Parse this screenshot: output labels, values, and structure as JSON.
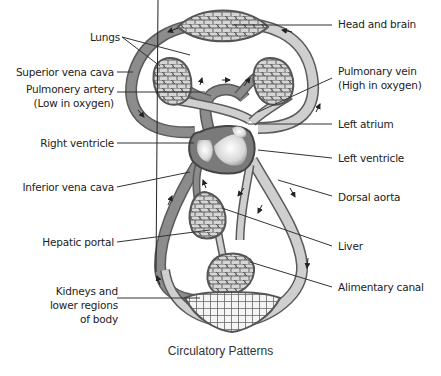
{
  "figure": {
    "caption": "Circulatory Patterns",
    "colors": {
      "deoxygenated_vessel": "#8c8c8c",
      "oxygenated_vessel": "#cfcfcf",
      "outline": "#5a5a5a",
      "capillary_fill": "#d6d6d6",
      "heart_fill": "#9a9a9a",
      "leader_line": "#333333"
    }
  },
  "labels": {
    "left": {
      "lungs": "Lungs",
      "superior_vena_cava": "Superior vena cava",
      "pulmonary_artery_1": "Pulmonery artery",
      "pulmonary_artery_2": "(Low in oxygen)",
      "right_ventricle": "Right ventricle",
      "inferior_vena_cava": "Inferior vena cava",
      "hepatic_portal": "Hepatic portal",
      "kidneys_1": "Kidneys and",
      "kidneys_2": "lower regions",
      "kidneys_3": "of body"
    },
    "right": {
      "head_and_brain": "Head and brain",
      "pulmonary_vein_1": "Pulmonary vein",
      "pulmonary_vein_2": "(High in oxygen)",
      "left_atrium": "Left atrium",
      "left_ventricle": "Left ventricle",
      "dorsal_aorta": "Dorsal aorta",
      "liver": "Liver",
      "alimentary_canal": "Alimentary canal"
    }
  }
}
